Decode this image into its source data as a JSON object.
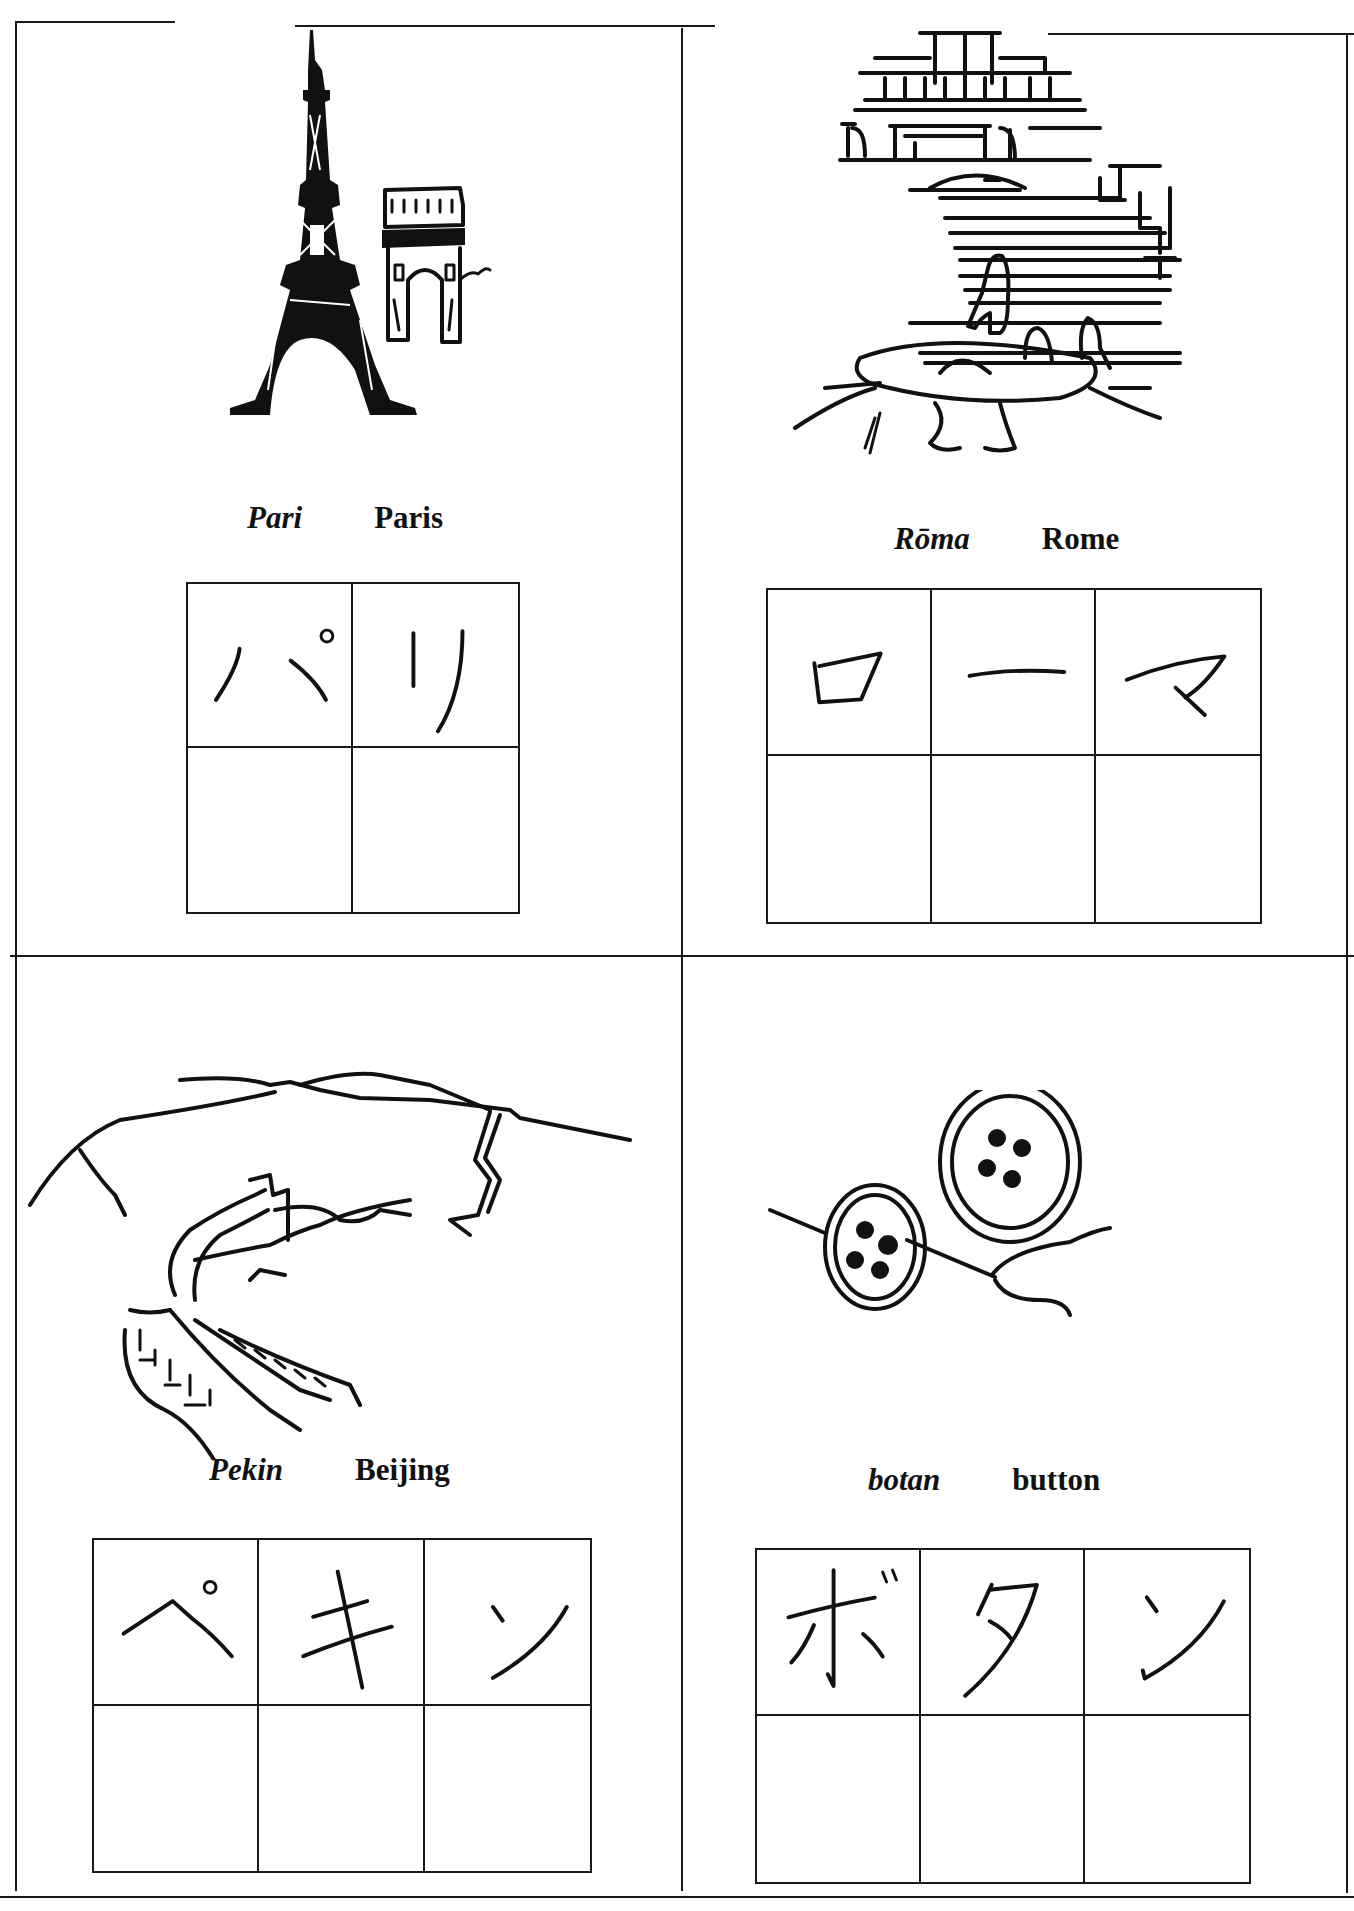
{
  "worksheet": {
    "cards": [
      {
        "id": "paris",
        "illustration": "eiffel-tower-and-arc-de-triomphe",
        "romaji": "Pari",
        "english": "Paris",
        "katakana": [
          "パ",
          "リ"
        ],
        "practice_rows": 1
      },
      {
        "id": "rome",
        "illustration": "spanish-steps-fountain",
        "romaji": "Rōma",
        "english": "Rome",
        "katakana": [
          "ロ",
          "ー",
          "マ"
        ],
        "practice_rows": 1
      },
      {
        "id": "beijing",
        "illustration": "great-wall",
        "romaji": "Pekin",
        "english": "Beijing",
        "katakana": [
          "ペ",
          "キ",
          "ン"
        ],
        "practice_rows": 1
      },
      {
        "id": "button",
        "illustration": "buttons-with-needle-and-thread",
        "romaji": "botan",
        "english": "button",
        "katakana": [
          "ボ",
          "タ",
          "ン"
        ],
        "practice_rows": 1
      }
    ],
    "ink_color": "#111111",
    "background_color": "#ffffff"
  }
}
